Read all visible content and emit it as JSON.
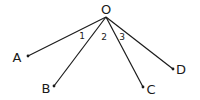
{
  "diagram": {
    "type": "angle-rays",
    "vertex": {
      "label": "O",
      "x": 106,
      "y": 17,
      "label_x": 106,
      "label_y": 14
    },
    "rays": [
      {
        "label": "A",
        "x": 28,
        "y": 56,
        "label_x": 17,
        "label_y": 62
      },
      {
        "label": "B",
        "x": 54,
        "y": 86,
        "label_x": 46,
        "label_y": 93
      },
      {
        "label": "C",
        "x": 143,
        "y": 87,
        "label_x": 151,
        "label_y": 94
      },
      {
        "label": "D",
        "x": 173,
        "y": 69,
        "label_x": 181,
        "label_y": 74
      }
    ],
    "angles": [
      {
        "label": "1",
        "x": 82,
        "y": 39
      },
      {
        "label": "2",
        "x": 104,
        "y": 40
      },
      {
        "label": "3",
        "x": 122,
        "y": 40
      }
    ],
    "line_color": "#1a1a1a"
  }
}
